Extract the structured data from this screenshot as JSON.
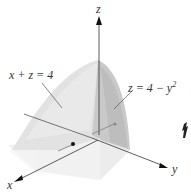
{
  "figure": {
    "axes": {
      "x_label": "x",
      "y_label": "y",
      "z_label": "z"
    },
    "surfaces": [
      {
        "id": "plane",
        "label": "x + z = 4"
      },
      {
        "id": "parabolic-cylinder",
        "label_main": "z = 4 − y",
        "label_exp": "2"
      }
    ],
    "colors": {
      "background": "#ffffff",
      "surface_light": "#e6e6e6",
      "surface_mid": "#d4d4d4",
      "surface_dark": "#bdbdbd",
      "base_light": "#efefef",
      "axis": "#333333",
      "leader_line": "#555555"
    }
  }
}
